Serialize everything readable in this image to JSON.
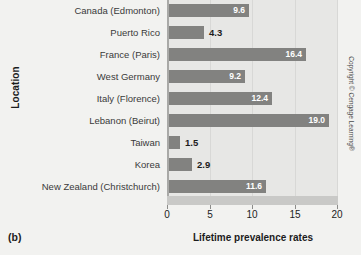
{
  "panel_label": "(b)",
  "copyright": "Copyright © Cengage Learning®",
  "chart_data": {
    "type": "bar",
    "orientation": "horizontal",
    "title": "",
    "xlabel": "Lifetime prevalence rates",
    "ylabel": "Location",
    "xlim": [
      0,
      20
    ],
    "xticks": [
      0,
      5,
      10,
      15,
      20
    ],
    "xtick_labels": [
      "0",
      "5",
      "10",
      "15",
      "20"
    ],
    "grid": true,
    "legend": false,
    "categories": [
      "Canada (Edmonton)",
      "Puerto Rico",
      "France (Paris)",
      "West Germany",
      "Italy (Florence)",
      "Lebanon (Beirut)",
      "Taiwan",
      "Korea",
      "New Zealand (Christchurch)"
    ],
    "values": [
      9.6,
      4.3,
      16.4,
      9.2,
      12.4,
      19.0,
      1.5,
      2.9,
      11.6
    ],
    "value_labels": [
      "9.6",
      "4.3",
      "16.4",
      "9.2",
      "12.4",
      "19.0",
      "1.5",
      "2.9",
      "11.6"
    ],
    "bar_color": "#828280",
    "plot_background": "#e7e7e5",
    "page_background": "#f2f2f0",
    "inside_label_color": "#ffffff",
    "outside_label_color": "#1c1c1c"
  }
}
